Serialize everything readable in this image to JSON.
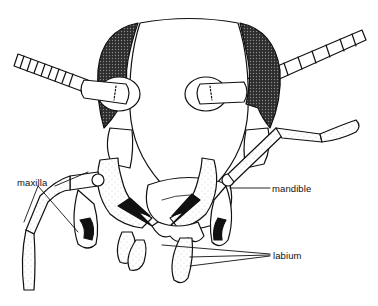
{
  "diagram": {
    "labels": [
      {
        "id": "maxilla",
        "text": "maxilla"
      },
      {
        "id": "mandible",
        "text": "mandible"
      },
      {
        "id": "labium",
        "text": "labium"
      }
    ],
    "colors": {
      "line": "#111111",
      "eye_fill": "#3a3a3a",
      "background": "#ffffff"
    }
  }
}
